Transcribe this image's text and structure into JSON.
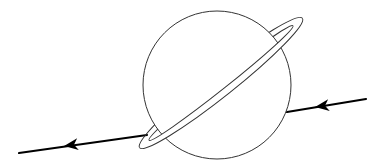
{
  "diagram": {
    "colors": {
      "background": "#ffffff",
      "planet_stroke": "#333333",
      "trajectory": "#000000"
    },
    "planet": {
      "cx": 217,
      "cy": 85,
      "r": 74
    },
    "ring": {
      "cx": 221,
      "cy": 83,
      "rotation": -38.5,
      "outer": {
        "rx": 104,
        "ry": 13
      },
      "inner": {
        "rx": 92,
        "ry": 6
      }
    },
    "trajectory": {
      "right_segment": {
        "x1": 366,
        "y1": 99,
        "x2": 287,
        "y2": 112
      },
      "left_segment": {
        "x1": 147,
        "y1": 135,
        "x2": 19,
        "y2": 153
      },
      "arrows": [
        {
          "name": "right-arrow",
          "x": 323,
          "y": 106,
          "direction": "left"
        },
        {
          "name": "left-arrow",
          "x": 72,
          "y": 145,
          "direction": "left"
        }
      ]
    }
  }
}
